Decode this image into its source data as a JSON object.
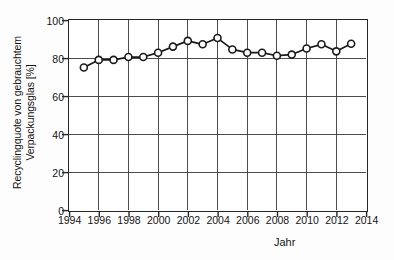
{
  "chart_data": {
    "type": "line",
    "title": "",
    "xlabel": "Jahr",
    "ylabel": "Recyclingquote von gebrauchtem Verpackungsglas [%]",
    "ylabel_line1": "Recyclingquote von gebrauchtem",
    "ylabel_line2": "Verpackungsglas [%]",
    "xlim": [
      1994,
      2014
    ],
    "ylim": [
      0,
      100
    ],
    "grid": true,
    "legend": "none",
    "marker": "open-circle",
    "line_color": "#1a1a1a",
    "marker_fill": "#ffffff",
    "xticks": [
      1994,
      1996,
      1998,
      2000,
      2002,
      2004,
      2006,
      2008,
      2010,
      2012,
      2014
    ],
    "xtick_labels": [
      "1994",
      "1996",
      "1998",
      "2000",
      "2002",
      "2004",
      "2006",
      "2008",
      "2010",
      "2012",
      "2014"
    ],
    "yticks": [
      0,
      20,
      40,
      60,
      80,
      100
    ],
    "ytick_labels": [
      "0",
      "20",
      "40",
      "60",
      "80",
      "100"
    ],
    "x": [
      1995,
      1996,
      1997,
      1998,
      1999,
      2000,
      2001,
      2002,
      2003,
      2004,
      2005,
      2006,
      2007,
      2008,
      2009,
      2010,
      2011,
      2012,
      2013
    ],
    "values": [
      75.0,
      79.0,
      79.0,
      80.5,
      80.5,
      82.8,
      86.0,
      89.0,
      87.2,
      90.5,
      84.5,
      82.8,
      82.8,
      81.2,
      81.8,
      85.0,
      87.2,
      83.5,
      87.5
    ],
    "series": [
      {
        "name": "Recyclingquote von gebrauchtem Verpackungsglas",
        "values": [
          75.0,
          79.0,
          79.0,
          80.5,
          80.5,
          82.8,
          86.0,
          89.0,
          87.2,
          90.5,
          84.5,
          82.8,
          82.8,
          81.2,
          81.8,
          85.0,
          87.2,
          83.5,
          87.5
        ]
      }
    ]
  }
}
